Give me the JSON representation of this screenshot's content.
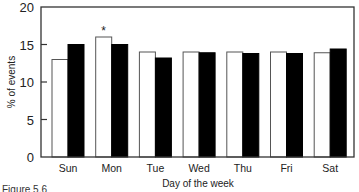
{
  "chart_data": {
    "type": "bar",
    "title": "",
    "xlabel": "Day of the week",
    "ylabel": "% of events",
    "categories": [
      "Sun",
      "Mon",
      "Tue",
      "Wed",
      "Thu",
      "Fri",
      "Sat"
    ],
    "series": [
      {
        "name": "Series A (white)",
        "color": "#ffffff",
        "values": [
          13.0,
          16.0,
          14.0,
          14.0,
          14.0,
          14.0,
          13.9
        ]
      },
      {
        "name": "Series B (black)",
        "color": "#000000",
        "values": [
          15.0,
          15.0,
          13.2,
          13.9,
          13.8,
          13.8,
          14.4
        ]
      }
    ],
    "annotations": [
      {
        "category": "Mon",
        "series": 0,
        "text": "*"
      }
    ],
    "ylim": [
      0,
      20
    ],
    "yticks": [
      0,
      5,
      10,
      15,
      20
    ],
    "grid": false,
    "legend": "none"
  },
  "caption": "Figure 5.6"
}
